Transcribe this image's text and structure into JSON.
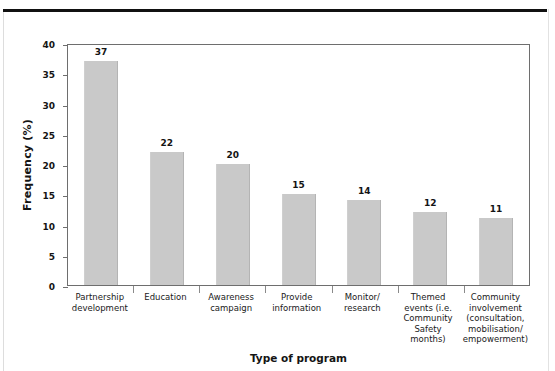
{
  "page": {
    "caption_fragment": ""
  },
  "chart_data": {
    "type": "bar",
    "title": "",
    "xlabel": "Type of program",
    "ylabel": "Frequency (%)",
    "ylim": [
      0,
      40
    ],
    "ytick_step": 5,
    "yticks": [
      0,
      5,
      10,
      15,
      20,
      25,
      30,
      35,
      40
    ],
    "ytick_labels": [
      "0",
      "5",
      "10",
      "15",
      "20",
      "25",
      "30",
      "35",
      "40"
    ],
    "grid": false,
    "legend": null,
    "bar_color": "#c9c9c9",
    "axis_color": "#6e6e6e",
    "categories": [
      "Partnership development",
      "Education",
      "Awareness campaign",
      "Provide information",
      "Monitor/ research",
      "Themed events (i.e. Community Safety months)",
      "Community involvement (consultation, mobilisation/ empowerment)"
    ],
    "category_label_lines": [
      [
        "Partnership",
        "development"
      ],
      [
        "Education"
      ],
      [
        "Awareness",
        "campaign"
      ],
      [
        "Provide",
        "information"
      ],
      [
        "Monitor/",
        "research"
      ],
      [
        "Themed",
        "events (i.e.",
        "Community",
        "Safety",
        "months)"
      ],
      [
        "Community",
        "involvement",
        "(consultation,",
        "mobilisation/",
        "empowerment)"
      ]
    ],
    "values": [
      37,
      22,
      20,
      15,
      14,
      12,
      11
    ],
    "value_labels": [
      "37",
      "22",
      "20",
      "15",
      "14",
      "12",
      "11"
    ]
  }
}
